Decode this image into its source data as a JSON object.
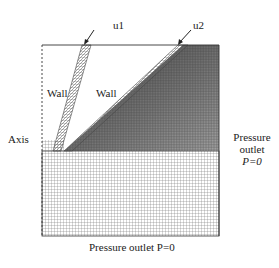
{
  "figure": {
    "type": "CFD mesh diagram",
    "header_fragment": "",
    "labels": {
      "inlet_1": "u1",
      "inlet_2": "u2",
      "wall_1": "Wall",
      "wall_2": "Wall",
      "axis": "Axis",
      "right_outlet_line1": "Pressure",
      "right_outlet_line2": "outlet",
      "right_outlet_line3": "P=0",
      "bottom_outlet": "Pressure outlet P=0"
    },
    "colors": {
      "mesh_line": "#555555",
      "boundary": "#333333",
      "dense_mesh": "#2a2a2a",
      "background": "#ffffff"
    }
  }
}
